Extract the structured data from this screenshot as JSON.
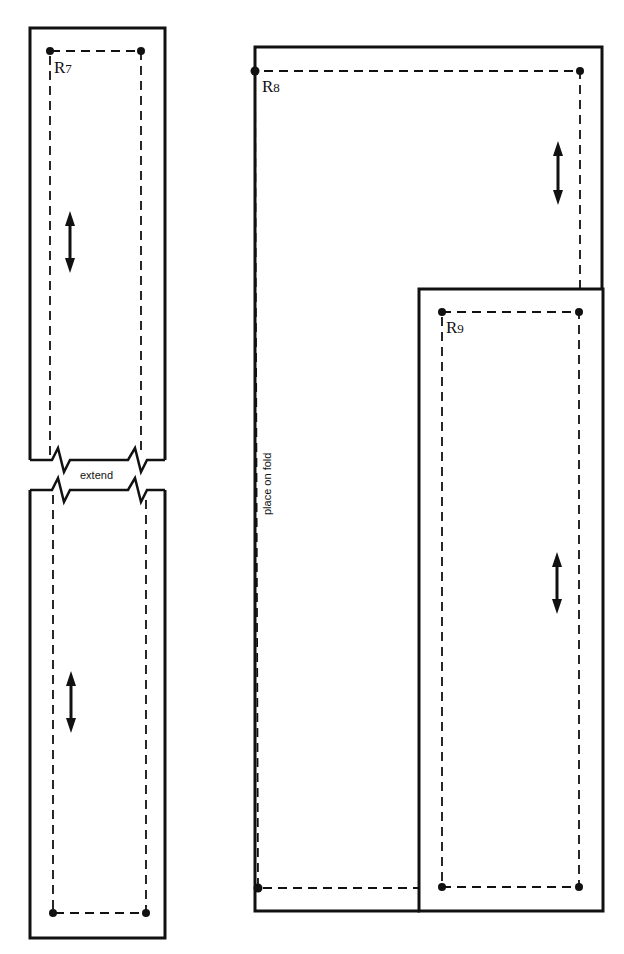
{
  "diagram": {
    "type": "sewing-pattern",
    "colors": {
      "ink": "#111111",
      "background": "#ffffff"
    },
    "pieces": [
      {
        "id": "R7",
        "label_letter": "R",
        "label_number": "7",
        "break_note": "extend",
        "grainline_count": 2
      },
      {
        "id": "R8",
        "label_letter": "R",
        "label_number": "8",
        "fold_note": "place on fold",
        "grainline_count": 1
      },
      {
        "id": "R9",
        "label_letter": "R",
        "label_number": "9",
        "grainline_count": 1
      }
    ],
    "legend": {
      "solid_line": "cutting line",
      "dashed_line": "stitching line",
      "double_arrow": "grainline",
      "dot": "matching point"
    }
  }
}
